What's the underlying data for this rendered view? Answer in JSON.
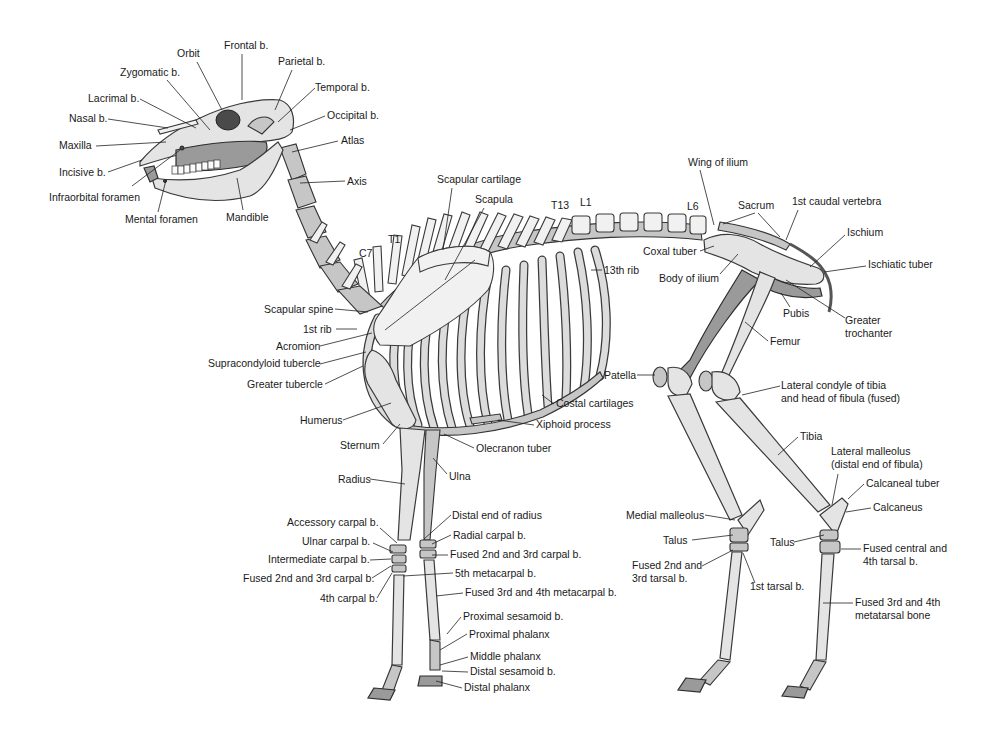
{
  "figure": {
    "colors": {
      "bone": "#e4e4e4",
      "bone_shadow": "#9a9a9a",
      "outline": "#3a3a3a",
      "label": "#1a1a1a",
      "background": "#ffffff"
    }
  },
  "labels": {
    "skull": [
      {
        "id": "orbit",
        "text": "Orbit",
        "x": 177,
        "y": 57,
        "anchor": "start",
        "line": [
          197,
          62,
          222,
          110
        ]
      },
      {
        "id": "frontal",
        "text": "Frontal b.",
        "x": 224,
        "y": 49,
        "anchor": "start",
        "line": [
          242,
          54,
          242,
          100
        ]
      },
      {
        "id": "parietal",
        "text": "Parietal b.",
        "x": 278,
        "y": 65,
        "anchor": "start",
        "line": [
          292,
          70,
          275,
          110
        ]
      },
      {
        "id": "zygomatic",
        "text": "Zygomatic b.",
        "x": 120,
        "y": 76,
        "anchor": "start",
        "line": [
          167,
          80,
          210,
          130
        ]
      },
      {
        "id": "temporal",
        "text": "Temporal b.",
        "x": 315,
        "y": 91,
        "anchor": "start",
        "line": [
          315,
          88,
          278,
          122
        ]
      },
      {
        "id": "lacrimal",
        "text": "Lacrimal b.",
        "x": 88,
        "y": 102,
        "anchor": "start",
        "line": [
          140,
          99,
          196,
          128
        ]
      },
      {
        "id": "occipital",
        "text": "Occipital b.",
        "x": 327,
        "y": 119,
        "anchor": "start",
        "line": [
          325,
          116,
          290,
          130
        ]
      },
      {
        "id": "nasal",
        "text": "Nasal b.",
        "x": 69,
        "y": 122,
        "anchor": "start",
        "line": [
          108,
          119,
          168,
          128
        ]
      },
      {
        "id": "maxilla",
        "text": "Maxilla",
        "x": 59,
        "y": 149,
        "anchor": "start",
        "line": [
          96,
          146,
          166,
          142
        ]
      },
      {
        "id": "atlas",
        "text": "Atlas",
        "x": 341,
        "y": 144,
        "anchor": "start",
        "line": [
          338,
          141,
          292,
          152
        ]
      },
      {
        "id": "incisive",
        "text": "Incisive b.",
        "x": 59,
        "y": 176,
        "anchor": "start",
        "line": [
          108,
          172,
          142,
          160
        ]
      },
      {
        "id": "axis",
        "text": "Axis",
        "x": 347,
        "y": 185,
        "anchor": "start",
        "line": [
          345,
          181,
          300,
          183
        ]
      },
      {
        "id": "infraorbital",
        "text": "Infraorbital foramen",
        "x": 49,
        "y": 201,
        "anchor": "start",
        "line": [
          132,
          186,
          180,
          150
        ]
      },
      {
        "id": "mental",
        "text": "Mental foramen",
        "x": 125,
        "y": 223,
        "anchor": "start",
        "line": [
          158,
          212,
          166,
          180
        ]
      },
      {
        "id": "mandible",
        "text": "Mandible",
        "x": 226,
        "y": 221,
        "anchor": "start",
        "line": [
          243,
          210,
          237,
          178
        ]
      }
    ],
    "trunk": [
      {
        "id": "scapular-cartilage",
        "text": "Scapular cartilage",
        "x": 437,
        "y": 183,
        "anchor": "start",
        "line": [
          452,
          188,
          443,
          250
        ]
      },
      {
        "id": "scapula",
        "text": "Scapula",
        "x": 475,
        "y": 203,
        "anchor": "start",
        "line": [
          484,
          208,
          445,
          280
        ]
      },
      {
        "id": "t13",
        "text": "T13",
        "x": 551,
        "y": 209,
        "anchor": "start",
        "line": null
      },
      {
        "id": "l1",
        "text": "L1",
        "x": 580,
        "y": 206,
        "anchor": "start",
        "line": null
      },
      {
        "id": "l6",
        "text": "L6",
        "x": 687,
        "y": 210,
        "anchor": "start",
        "line": null
      },
      {
        "id": "t1",
        "text": "T1",
        "x": 388,
        "y": 243,
        "anchor": "start",
        "line": null
      },
      {
        "id": "c7",
        "text": "C7",
        "x": 359,
        "y": 257,
        "anchor": "start",
        "line": null
      },
      {
        "id": "13th-rib",
        "text": "13th rib",
        "x": 604,
        "y": 274,
        "anchor": "start",
        "line": [
          602,
          270,
          591,
          270
        ]
      },
      {
        "id": "wing-of-ilium",
        "text": "Wing of ilium",
        "x": 688,
        "y": 166,
        "anchor": "start",
        "line": [
          700,
          170,
          714,
          225
        ]
      },
      {
        "id": "sacrum",
        "text": "Sacrum",
        "x": 738,
        "y": 209,
        "anchor": "start",
        "line": [
          755,
          213,
          723,
          224
        ]
      },
      {
        "id": "sacrum-2",
        "text": "",
        "x": 0,
        "y": 0,
        "anchor": "start",
        "line": [
          758,
          213,
          780,
          237
        ]
      },
      {
        "id": "1st-caudal",
        "text": "1st caudal vertebra",
        "x": 792,
        "y": 205,
        "anchor": "start",
        "line": [
          798,
          210,
          786,
          240
        ]
      },
      {
        "id": "coxal-tuber",
        "text": "Coxal tuber",
        "x": 643,
        "y": 255,
        "anchor": "start",
        "line": [
          700,
          251,
          714,
          246
        ]
      },
      {
        "id": "ischium",
        "text": "Ischium",
        "x": 847,
        "y": 236,
        "anchor": "start",
        "line": [
          845,
          235,
          810,
          267
        ]
      },
      {
        "id": "body-of-ilium",
        "text": "Body of ilium",
        "x": 659,
        "y": 282,
        "anchor": "start",
        "line": [
          720,
          274,
          738,
          254
        ]
      },
      {
        "id": "ischiatic-tuber",
        "text": "Ischiatic tuber",
        "x": 868,
        "y": 268,
        "anchor": "start",
        "line": [
          866,
          266,
          824,
          272
        ]
      },
      {
        "id": "pubis",
        "text": "Pubis",
        "x": 783,
        "y": 317,
        "anchor": "start",
        "line": [
          790,
          307,
          781,
          293
        ]
      },
      {
        "id": "greater-trochanter",
        "text": "Greater",
        "x": 845,
        "y": 324,
        "anchor": "start",
        "line": [
          845,
          318,
          786,
          280
        ]
      },
      {
        "id": "greater-trochanter-2",
        "text": "trochanter",
        "x": 845,
        "y": 337,
        "anchor": "start",
        "line": null
      },
      {
        "id": "femur",
        "text": "Femur",
        "x": 770,
        "y": 345,
        "anchor": "start",
        "line": [
          768,
          341,
          745,
          322
        ]
      }
    ],
    "forelimb": [
      {
        "id": "scapular-spine",
        "text": "Scapular spine",
        "x": 264,
        "y": 313,
        "anchor": "start",
        "line": [
          335,
          309,
          368,
          312
        ]
      },
      {
        "id": "1st-rib",
        "text": "1st rib",
        "x": 303,
        "y": 333,
        "anchor": "start",
        "line": [
          336,
          329,
          357,
          329
        ]
      },
      {
        "id": "acromion",
        "text": "Acromion",
        "x": 276,
        "y": 350,
        "anchor": "start",
        "line": [
          320,
          346,
          372,
          333
        ]
      },
      {
        "id": "supracondyloid",
        "text": "Supracondyloid tubercle",
        "x": 208,
        "y": 367,
        "anchor": "start",
        "line": [
          320,
          364,
          366,
          352
        ]
      },
      {
        "id": "greater-tubercle",
        "text": "Greater tubercle",
        "x": 247,
        "y": 388,
        "anchor": "start",
        "line": [
          325,
          384,
          363,
          366
        ]
      },
      {
        "id": "humerus",
        "text": "Humerus",
        "x": 300,
        "y": 424,
        "anchor": "start",
        "line": [
          343,
          420,
          391,
          403
        ]
      },
      {
        "id": "sternum",
        "text": "Sternum",
        "x": 340,
        "y": 449,
        "anchor": "start",
        "line": [
          383,
          444,
          400,
          424
        ]
      },
      {
        "id": "costal-cartilages",
        "text": "Costal cartilages",
        "x": 556,
        "y": 407,
        "anchor": "start",
        "line": [
          554,
          404,
          542,
          395
        ]
      },
      {
        "id": "xiphoid",
        "text": "Xiphoid process",
        "x": 536,
        "y": 428,
        "anchor": "start",
        "line": [
          534,
          425,
          498,
          420
        ]
      },
      {
        "id": "olecranon",
        "text": "Olecranon tuber",
        "x": 476,
        "y": 452,
        "anchor": "start",
        "line": [
          474,
          448,
          444,
          434
        ]
      },
      {
        "id": "radius",
        "text": "Radius",
        "x": 338,
        "y": 483,
        "anchor": "start",
        "line": [
          370,
          479,
          405,
          484
        ]
      },
      {
        "id": "ulna",
        "text": "Ulna",
        "x": 449,
        "y": 480,
        "anchor": "start",
        "line": [
          447,
          474,
          433,
          458
        ]
      },
      {
        "id": "distal-end-radius",
        "text": "Distal end of radius",
        "x": 452,
        "y": 519,
        "anchor": "start",
        "line": [
          451,
          515,
          424,
          539
        ]
      },
      {
        "id": "accessory-carpal",
        "text": "Accessory carpal b.",
        "x": 287,
        "y": 526,
        "anchor": "start",
        "line": [
          380,
          528,
          397,
          543
        ]
      },
      {
        "id": "radial-carpal",
        "text": "Radial carpal b.",
        "x": 453,
        "y": 539,
        "anchor": "start",
        "line": [
          451,
          535,
          432,
          544
        ]
      },
      {
        "id": "ulnar-carpal",
        "text": "Ulnar carpal b.",
        "x": 302,
        "y": 545,
        "anchor": "start",
        "line": [
          373,
          543,
          393,
          552
        ]
      },
      {
        "id": "fused-2-3-carpal-r",
        "text": "Fused 2nd and 3rd carpal b.",
        "x": 450,
        "y": 558,
        "anchor": "start",
        "line": [
          448,
          555,
          432,
          555
        ]
      },
      {
        "id": "intermediate-carpal",
        "text": "Intermediate carpal b.",
        "x": 268,
        "y": 563,
        "anchor": "start",
        "line": [
          370,
          560,
          391,
          559
        ]
      },
      {
        "id": "5th-metacarpal",
        "text": "5th metacarpal b.",
        "x": 455,
        "y": 577,
        "anchor": "start",
        "line": [
          453,
          573,
          403,
          576
        ]
      },
      {
        "id": "fused-2-3-carpal-l",
        "text": "Fused 2nd and 3rd carpal b.",
        "x": 243,
        "y": 582,
        "anchor": "start",
        "line": [
          372,
          578,
          391,
          566
        ]
      },
      {
        "id": "fused-3-4-metacarpal",
        "text": "Fused 3rd and 4th metacarpal b.",
        "x": 465,
        "y": 596,
        "anchor": "start",
        "line": [
          463,
          593,
          436,
          596
        ]
      },
      {
        "id": "4th-carpal",
        "text": "4th carpal b.",
        "x": 320,
        "y": 602,
        "anchor": "start",
        "line": [
          377,
          598,
          392,
          573
        ]
      },
      {
        "id": "proximal-sesamoid",
        "text": "Proximal sesamoid b.",
        "x": 463,
        "y": 620,
        "anchor": "start",
        "line": [
          461,
          617,
          447,
          634
        ]
      },
      {
        "id": "proximal-phalanx",
        "text": "Proximal phalanx",
        "x": 469,
        "y": 638,
        "anchor": "start",
        "line": [
          467,
          634,
          440,
          650
        ]
      },
      {
        "id": "middle-phalanx",
        "text": "Middle phalanx",
        "x": 470,
        "y": 660,
        "anchor": "start",
        "line": [
          468,
          657,
          440,
          665
        ]
      },
      {
        "id": "distal-sesamoid",
        "text": "Distal sesamoid b.",
        "x": 470,
        "y": 675,
        "anchor": "start",
        "line": [
          468,
          672,
          442,
          671
        ]
      },
      {
        "id": "distal-phalanx",
        "text": "Distal phalanx",
        "x": 464,
        "y": 691,
        "anchor": "start",
        "line": [
          462,
          688,
          436,
          681
        ]
      }
    ],
    "hindlimb": [
      {
        "id": "patella",
        "text": "Patella",
        "x": 604,
        "y": 379,
        "anchor": "start",
        "line": [
          637,
          375,
          655,
          375
        ]
      },
      {
        "id": "lateral-condyle",
        "text": "Lateral condyle of tibia",
        "x": 781,
        "y": 389,
        "anchor": "start",
        "line": [
          780,
          386,
          742,
          395
        ]
      },
      {
        "id": "lateral-condyle-2",
        "text": "and head of fibula (fused)",
        "x": 781,
        "y": 402,
        "anchor": "start",
        "line": null
      },
      {
        "id": "tibia",
        "text": "Tibia",
        "x": 800,
        "y": 440,
        "anchor": "start",
        "line": [
          798,
          437,
          778,
          455
        ]
      },
      {
        "id": "lateral-malleolus",
        "text": "Lateral malleolus",
        "x": 831,
        "y": 455,
        "anchor": "start",
        "line": [
          838,
          474,
          832,
          505
        ]
      },
      {
        "id": "lateral-malleolus-2",
        "text": "(distal end of fibula)",
        "x": 831,
        "y": 468,
        "anchor": "start",
        "line": null
      },
      {
        "id": "calcaneal-tuber",
        "text": "Calcaneal tuber",
        "x": 866,
        "y": 487,
        "anchor": "start",
        "line": [
          864,
          484,
          848,
          499
        ]
      },
      {
        "id": "calcaneus",
        "text": "Calcaneus",
        "x": 873,
        "y": 511,
        "anchor": "start",
        "line": [
          871,
          508,
          846,
          512
        ]
      },
      {
        "id": "medial-malleolus",
        "text": "Medial malleolus",
        "x": 626,
        "y": 519,
        "anchor": "start",
        "line": [
          705,
          515,
          735,
          520
        ]
      },
      {
        "id": "talus-l",
        "text": "Talus",
        "x": 663,
        "y": 544,
        "anchor": "start",
        "line": [
          692,
          540,
          733,
          535
        ]
      },
      {
        "id": "talus-r",
        "text": "Talus",
        "x": 770,
        "y": 546,
        "anchor": "start",
        "line": [
          794,
          542,
          824,
          535
        ]
      },
      {
        "id": "fused-central-4th",
        "text": "Fused central and",
        "x": 863,
        "y": 552,
        "anchor": "start",
        "line": [
          861,
          549,
          841,
          549
        ]
      },
      {
        "id": "fused-central-4th-2",
        "text": "4th tarsal b.",
        "x": 863,
        "y": 565,
        "anchor": "start",
        "line": null
      },
      {
        "id": "fused-2-3-tarsal",
        "text": "Fused 2nd and",
        "x": 632,
        "y": 569,
        "anchor": "start",
        "line": [
          702,
          566,
          733,
          550
        ]
      },
      {
        "id": "fused-2-3-tarsal-2",
        "text": "3rd tarsal b.",
        "x": 632,
        "y": 582,
        "anchor": "start",
        "line": null
      },
      {
        "id": "1st-tarsal",
        "text": "1st tarsal b.",
        "x": 750,
        "y": 590,
        "anchor": "start",
        "line": [
          755,
          583,
          743,
          553
        ]
      },
      {
        "id": "fused-3-4-metatarsal",
        "text": "Fused 3rd and 4th",
        "x": 855,
        "y": 606,
        "anchor": "start",
        "line": [
          853,
          603,
          823,
          603
        ]
      },
      {
        "id": "fused-3-4-metatarsal-2",
        "text": "metatarsal bone",
        "x": 855,
        "y": 619,
        "anchor": "start",
        "line": null
      }
    ]
  }
}
